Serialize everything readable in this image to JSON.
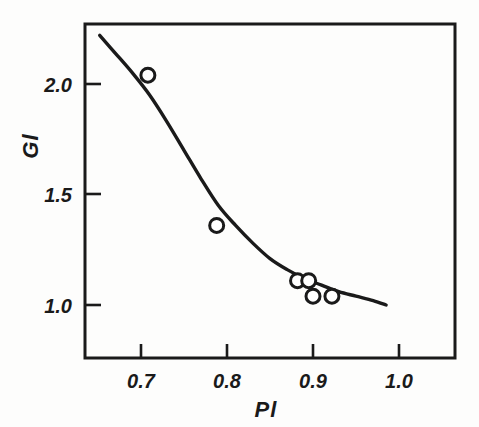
{
  "chart_data": {
    "type": "scatter",
    "title": "",
    "subtitle": "",
    "xlabel": "Pl",
    "ylabel": "Gl",
    "xlim": [
      0.648,
      1.045
    ],
    "ylim": [
      0.76,
      2.27
    ],
    "xticks": [
      0.7,
      0.8,
      0.9,
      1.0
    ],
    "xtick_labels": [
      "0.7",
      "0.8",
      "0.9",
      "1.0"
    ],
    "yticks": [
      1.0,
      1.5,
      2.0
    ],
    "ytick_labels": [
      "1.0",
      "1.5",
      "2.0"
    ],
    "grid": false,
    "legend": null,
    "frame": "box",
    "tick_direction": "in",
    "series": [
      {
        "name": "measured points",
        "type": "scatter",
        "marker": "open-circle",
        "color": "#1a1a1a",
        "points": [
          {
            "x": 0.708,
            "y": 2.04
          },
          {
            "x": 0.788,
            "y": 1.36
          },
          {
            "x": 0.882,
            "y": 1.11
          },
          {
            "x": 0.895,
            "y": 1.11
          },
          {
            "x": 0.9,
            "y": 1.04
          },
          {
            "x": 0.922,
            "y": 1.04
          }
        ]
      },
      {
        "name": "fitted curve",
        "type": "line",
        "color": "#1a1a1a",
        "points": [
          {
            "x": 0.652,
            "y": 2.22
          },
          {
            "x": 0.67,
            "y": 2.14
          },
          {
            "x": 0.69,
            "y": 2.05
          },
          {
            "x": 0.71,
            "y": 1.95
          },
          {
            "x": 0.73,
            "y": 1.83
          },
          {
            "x": 0.75,
            "y": 1.7
          },
          {
            "x": 0.77,
            "y": 1.57
          },
          {
            "x": 0.79,
            "y": 1.45
          },
          {
            "x": 0.81,
            "y": 1.36
          },
          {
            "x": 0.83,
            "y": 1.28
          },
          {
            "x": 0.85,
            "y": 1.21
          },
          {
            "x": 0.87,
            "y": 1.16
          },
          {
            "x": 0.89,
            "y": 1.12
          },
          {
            "x": 0.91,
            "y": 1.09
          },
          {
            "x": 0.93,
            "y": 1.06
          },
          {
            "x": 0.95,
            "y": 1.04
          },
          {
            "x": 0.97,
            "y": 1.02
          },
          {
            "x": 0.985,
            "y": 1.0
          }
        ]
      }
    ]
  },
  "axes": {
    "x_tick_labels": [
      "0.7",
      "0.8",
      "0.9",
      "1.0"
    ],
    "y_tick_labels": [
      "2.0",
      "1.5",
      "1.0"
    ],
    "x_axis_title": "Pl",
    "y_axis_title": "Gl"
  },
  "style": {
    "line_color": "#1a1a1a",
    "frame_color": "#1a1a1a",
    "marker_face": "#ffffff",
    "background": "#fdfdfc"
  }
}
